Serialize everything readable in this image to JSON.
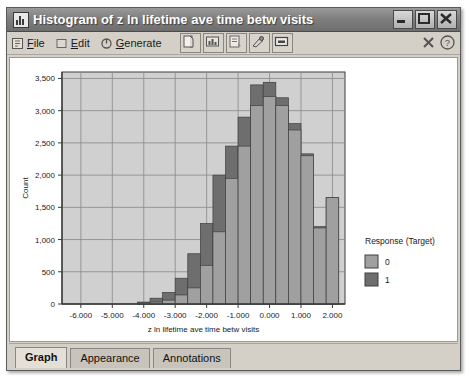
{
  "window": {
    "title": "Histogram of z ln lifetime ave time betw visits",
    "icon": "histogram-icon",
    "buttons": {
      "minimize": "minimize-button",
      "maximize": "maximize-button",
      "close": "close-button"
    }
  },
  "toolbar": {
    "menus": [
      {
        "label_pre": "",
        "accel": "F",
        "label_post": "ile",
        "name": "menu-file",
        "glyph": "file-icon"
      },
      {
        "label_pre": "",
        "accel": "E",
        "label_post": "dit",
        "name": "menu-edit",
        "glyph": "edit-icon"
      },
      {
        "label_pre": "",
        "accel": "G",
        "label_post": "enerate",
        "name": "menu-generate",
        "glyph": "generate-icon"
      }
    ],
    "buttons": [
      {
        "name": "copy-button",
        "icon": "copy-icon"
      },
      {
        "name": "export-chart-button",
        "icon": "export-chart-icon"
      },
      {
        "name": "print-button",
        "icon": "print-icon"
      },
      {
        "name": "edit-graph-button",
        "icon": "pencil-icon"
      },
      {
        "name": "display-button",
        "icon": "display-icon"
      }
    ],
    "right_buttons": [
      {
        "name": "close-view-button",
        "icon": "x-icon"
      },
      {
        "name": "help-button",
        "icon": "question-mark-icon"
      }
    ]
  },
  "tabs": [
    {
      "label": "Graph",
      "active": true
    },
    {
      "label": "Appearance",
      "active": false
    },
    {
      "label": "Annotations",
      "active": false
    }
  ],
  "legend": {
    "title": "Response (Target)",
    "entries": [
      {
        "label": "0",
        "color": "#a0a0a0"
      },
      {
        "label": "1",
        "color": "#6e6e6e"
      }
    ]
  },
  "colors": {
    "plot_background": "#d0d0d0",
    "grid": "#8f8f8f",
    "axis": "#3a3a3a",
    "series_0": "#a0a0a0",
    "series_1": "#6e6e6e",
    "window_background": "#d4d0c8",
    "titlebar": "#7f7f7f"
  },
  "chart_data": {
    "type": "bar",
    "subtype": "overlaid-histogram",
    "title": "",
    "xlabel": "z ln lifetime ave time betw visits",
    "ylabel": "Count",
    "xlim": [
      -6.6,
      2.4
    ],
    "ylim": [
      0,
      3600
    ],
    "grid": true,
    "legend_position": "right",
    "xticks": [
      "-6.000",
      "-5.000",
      "-4.000",
      "-3.000",
      "-2.000",
      "-1.000",
      "0.000",
      "1.000",
      "2.000"
    ],
    "xtick_values": [
      -6,
      -5,
      -4,
      -3,
      -2,
      -1,
      0,
      1,
      2
    ],
    "yticks": [
      "0",
      "500",
      "1,000",
      "1,500",
      "2,000",
      "2,500",
      "3,000",
      "3,500"
    ],
    "ytick_values": [
      0,
      500,
      1000,
      1500,
      2000,
      2500,
      3000,
      3500
    ],
    "bin_width": 0.4,
    "bin_starts": [
      -4.2,
      -3.8,
      -3.4,
      -3.0,
      -2.6,
      -2.2,
      -1.8,
      -1.4,
      -1.0,
      -0.6,
      -0.2,
      0.2,
      0.6,
      1.0,
      1.4,
      1.8
    ],
    "bin_centers": [
      -4.0,
      -3.6,
      -3.2,
      -2.8,
      -2.4,
      -2.0,
      -1.6,
      -1.2,
      -0.8,
      -0.4,
      0.0,
      0.4,
      0.8,
      1.2,
      1.6,
      2.0
    ],
    "series": [
      {
        "name": "0",
        "color": "#a0a0a0",
        "values": [
          20,
          30,
          60,
          140,
          250,
          600,
          1120,
          1950,
          2450,
          3080,
          3220,
          3080,
          2700,
          2300,
          1180,
          1650
        ]
      },
      {
        "name": "1",
        "color": "#6e6e6e",
        "values": [
          30,
          90,
          180,
          400,
          780,
          1250,
          2000,
          2450,
          2900,
          3400,
          3440,
          3200,
          2800,
          2330,
          1200,
          1650
        ]
      }
    ]
  }
}
